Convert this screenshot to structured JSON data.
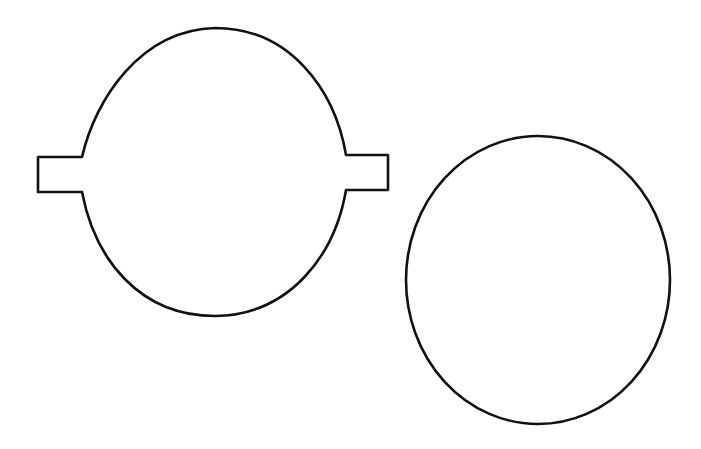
{
  "figure": {
    "stroke_color": "#111111",
    "background": "#ffffff",
    "shapes": [
      {
        "name": "circle-with-tabs",
        "description": "Circle with rectangular tabs on left and right"
      },
      {
        "name": "plain-circle",
        "description": "Plain circle"
      }
    ]
  }
}
